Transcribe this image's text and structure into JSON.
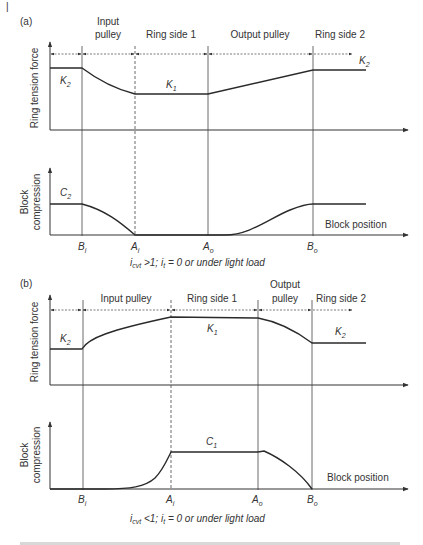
{
  "page_marker": "|",
  "panels": [
    {
      "id": "a",
      "label": "(a)",
      "segments": [
        {
          "label_lines": [
            "Input",
            "pulley"
          ]
        },
        {
          "label_lines": [
            "Ring side 1"
          ]
        },
        {
          "label_lines": [
            "Output pulley"
          ]
        },
        {
          "label_lines": [
            "Ring side 2"
          ]
        }
      ],
      "top_ylabel": "Ring tension force",
      "bottom_ylabel_lines": [
        "Block",
        "compression"
      ],
      "tension_labels": [
        {
          "main": "K",
          "sub": "2"
        },
        {
          "main": "K",
          "sub": "1"
        },
        {
          "main": "K",
          "sub": "2"
        }
      ],
      "compression_labels": [
        {
          "main": "C",
          "sub": "2"
        }
      ],
      "xlabel": "Block position",
      "positions": [
        {
          "main": "B",
          "sub": "i"
        },
        {
          "main": "A",
          "sub": "i"
        },
        {
          "main": "A",
          "sub": "o"
        },
        {
          "main": "B",
          "sub": "o"
        }
      ],
      "condition": {
        "var": "i",
        "var_sub": "cvt",
        "op": " >1; ",
        "var2": "i",
        "var2_sub": "t",
        "rest": " = 0 or under light load"
      }
    },
    {
      "id": "b",
      "label": "(b)",
      "segments": [
        {
          "label_lines": [
            "Input pulley"
          ]
        },
        {
          "label_lines": [
            "Ring side 1"
          ]
        },
        {
          "label_lines": [
            "Output",
            "pulley"
          ]
        },
        {
          "label_lines": [
            "Ring side 2"
          ]
        }
      ],
      "top_ylabel": "Ring tension force",
      "bottom_ylabel_lines": [
        "Block",
        "compression"
      ],
      "tension_labels": [
        {
          "main": "K",
          "sub": "2"
        },
        {
          "main": "K",
          "sub": "1"
        },
        {
          "main": "K",
          "sub": "2"
        }
      ],
      "compression_labels": [
        {
          "main": "C",
          "sub": "1"
        }
      ],
      "xlabel": "Block position",
      "positions": [
        {
          "main": "B",
          "sub": "i"
        },
        {
          "main": "A",
          "sub": "i"
        },
        {
          "main": "A",
          "sub": "o"
        },
        {
          "main": "B",
          "sub": "o"
        }
      ],
      "condition": {
        "var": "i",
        "var_sub": "cvt",
        "op": " <1; ",
        "var2": "i",
        "var2_sub": "t",
        "rest": " = 0 or under light load"
      }
    }
  ]
}
